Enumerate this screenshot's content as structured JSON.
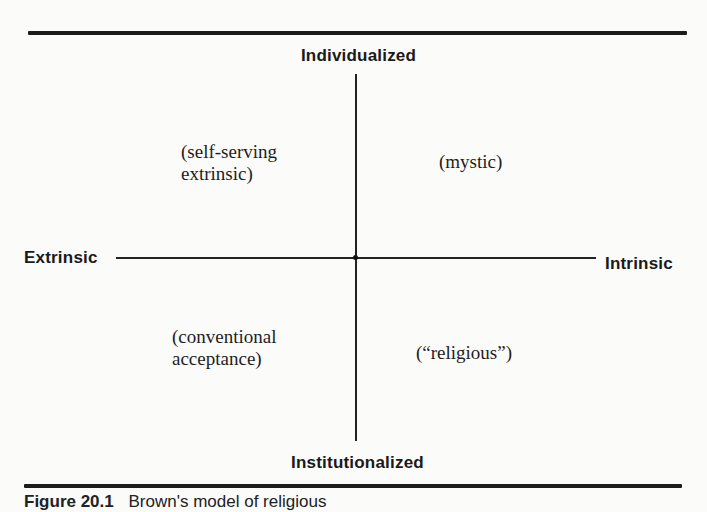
{
  "diagram": {
    "type": "quadrant",
    "axes": {
      "vertical": {
        "top_label": "Individualized",
        "bottom_label": "Institutionalized"
      },
      "horizontal": {
        "left_label": "Extrinsic",
        "right_label": "Intrinsic"
      }
    },
    "quadrants": {
      "top_left": {
        "lines": [
          "(self-serving",
          "extrinsic)"
        ]
      },
      "top_right": {
        "lines": [
          "(mystic)"
        ]
      },
      "bottom_left": {
        "lines": [
          "(conventional",
          "acceptance)"
        ]
      },
      "bottom_right": {
        "lines": [
          "(“religious”)"
        ]
      }
    }
  },
  "caption": {
    "figure_number": "Figure 20.1",
    "text": "Brown's model of religious"
  },
  "colors": {
    "ink": "#1a1a1a",
    "background": "#fbfbfa"
  }
}
